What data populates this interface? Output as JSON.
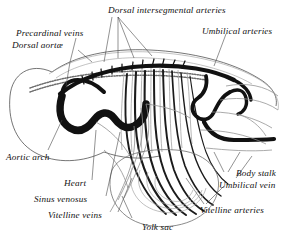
{
  "figure": {
    "kind": "anatomical-diagram",
    "background_color": "#ffffff",
    "ink_color": "#111111",
    "light_vessel_color": "#8a8a8a",
    "mid_vessel_color": "#555555"
  },
  "labels": {
    "precardinal_veins": "Precardinal veins",
    "dorsal_aortae": "Dorsal aortæ",
    "dorsal_intersegmental_arteries": "Dorsal intersegmental arteries",
    "umbilical_arteries": "Umbilical arteries",
    "aortic_arch": "Aortic arch",
    "heart": "Heart",
    "sinus_venosus": "Sinus venosus",
    "vitelline_veins": "Vitelline veins",
    "yolk_sac": "Yolk sac",
    "body_stalk": "Body stalk",
    "umbilical_vein": "Umbilical vein",
    "vitelline_arteries": "Vitelline arteries"
  }
}
